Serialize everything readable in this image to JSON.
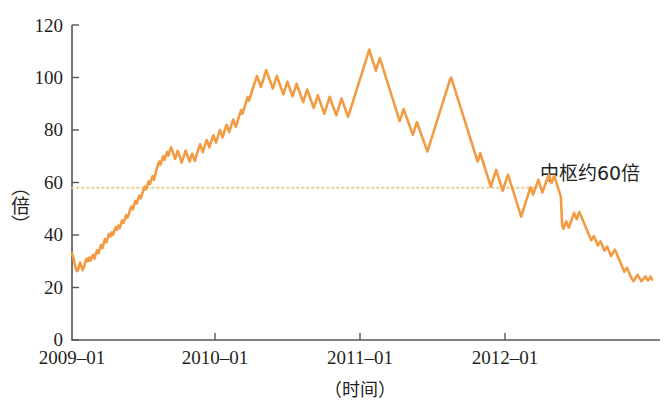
{
  "chart_data": {
    "type": "line",
    "title": "",
    "xlabel": "（时间）",
    "ylabel": "（倍）",
    "ylim": [
      0,
      120
    ],
    "yticks": [
      0,
      20,
      40,
      60,
      80,
      100,
      120
    ],
    "ytick_labels": [
      "0",
      "20",
      "40",
      "60",
      "80",
      "100",
      "120"
    ],
    "xticks": [
      "2009-01",
      "2010-01",
      "2011-01",
      "2012-01"
    ],
    "xtick_labels": [
      "2009–01",
      "2010–01",
      "2011–01",
      "2012–01"
    ],
    "xlim": [
      "2009-01",
      "2012-11"
    ],
    "grid": false,
    "legend": null,
    "series_color": "#F39B42",
    "reference_line": {
      "value": 58,
      "color": "#E8CE8A",
      "style": "dotted",
      "label": "中枢约60倍",
      "x_start": "2009-01",
      "x_end": "2012-04"
    },
    "annotations": [
      {
        "text": "中枢约60倍",
        "value": 60
      }
    ],
    "series": [
      {
        "name": "市盈率",
        "values": [
          33.0,
          31.5,
          29.0,
          27.0,
          26.2,
          27.5,
          29.5,
          28.2,
          26.6,
          27.8,
          29.6,
          31.0,
          30.0,
          31.4,
          30.2,
          31.6,
          32.4,
          31.0,
          32.8,
          34.2,
          33.0,
          34.6,
          36.2,
          35.0,
          36.8,
          38.4,
          37.2,
          38.8,
          40.4,
          39.4,
          41.0,
          40.0,
          41.6,
          43.0,
          42.0,
          43.6,
          42.6,
          44.2,
          45.6,
          44.6,
          46.0,
          47.6,
          46.6,
          48.0,
          49.6,
          50.8,
          49.8,
          51.4,
          53.0,
          52.0,
          53.6,
          55.0,
          54.0,
          55.6,
          57.0,
          58.4,
          57.4,
          59.0,
          60.4,
          59.4,
          61.0,
          62.4,
          61.0,
          63.0,
          65.0,
          66.6,
          68.0,
          66.8,
          68.4,
          70.0,
          68.6,
          70.2,
          71.6,
          70.2,
          72.0,
          73.4,
          72.0,
          70.6,
          69.0,
          70.4,
          72.0,
          70.6,
          69.2,
          67.6,
          69.0,
          70.6,
          72.2,
          70.8,
          69.4,
          68.0,
          69.6,
          71.0,
          69.6,
          68.2,
          70.0,
          71.6,
          73.2,
          74.6,
          73.0,
          71.6,
          73.2,
          74.8,
          76.2,
          74.8,
          73.4,
          75.0,
          76.6,
          78.0,
          76.6,
          75.2,
          76.8,
          78.4,
          80.0,
          78.6,
          77.2,
          78.8,
          80.4,
          82.0,
          80.6,
          79.2,
          80.8,
          82.4,
          84.0,
          82.6,
          81.2,
          82.8,
          84.4,
          86.0,
          87.6,
          86.2,
          87.8,
          89.4,
          91.0,
          92.6,
          91.2,
          92.8,
          94.4,
          96.0,
          97.6,
          99.0,
          100.6,
          99.2,
          97.8,
          96.4,
          98.0,
          99.6,
          101.2,
          102.8,
          101.4,
          100.0,
          98.6,
          97.2,
          95.8,
          97.4,
          99.0,
          100.6,
          99.2,
          97.8,
          96.4,
          95.0,
          93.6,
          95.2,
          96.8,
          98.4,
          97.0,
          95.6,
          94.2,
          92.8,
          94.4,
          96.0,
          97.6,
          96.2,
          94.8,
          93.4,
          92.0,
          90.6,
          92.2,
          93.8,
          95.4,
          94.0,
          92.6,
          91.2,
          89.8,
          88.4,
          90.0,
          91.6,
          93.2,
          91.8,
          90.4,
          89.0,
          87.6,
          86.2,
          87.8,
          89.4,
          91.0,
          92.6,
          91.2,
          89.8,
          88.4,
          87.0,
          85.6,
          87.2,
          88.8,
          90.4,
          92.0,
          90.6,
          89.2,
          87.8,
          86.4,
          85.0,
          86.6,
          88.2,
          89.8,
          91.4,
          93.0,
          94.6,
          96.2,
          97.8,
          99.4,
          101.0,
          102.6,
          104.2,
          105.8,
          107.4,
          109.0,
          110.6,
          109.0,
          107.4,
          105.8,
          104.2,
          102.6,
          104.2,
          105.8,
          107.4,
          105.8,
          104.2,
          102.6,
          101.0,
          99.4,
          97.8,
          96.2,
          94.6,
          93.0,
          91.4,
          89.8,
          88.2,
          86.6,
          85.0,
          83.4,
          84.8,
          86.4,
          88.0,
          86.6,
          85.2,
          83.8,
          82.4,
          81.0,
          79.6,
          78.2,
          79.8,
          81.4,
          83.0,
          81.6,
          80.2,
          78.8,
          77.4,
          76.0,
          74.6,
          73.2,
          71.8,
          73.4,
          75.0,
          76.6,
          78.2,
          79.8,
          81.4,
          83.0,
          84.6,
          86.2,
          87.8,
          89.4,
          91.0,
          92.6,
          94.2,
          95.8,
          97.4,
          99.0,
          100.0,
          98.4,
          96.8,
          95.2,
          93.6,
          92.0,
          90.4,
          88.8,
          87.2,
          85.6,
          84.0,
          82.4,
          80.8,
          79.2,
          77.6,
          76.0,
          74.4,
          72.8,
          71.2,
          69.6,
          68.0,
          69.6,
          71.2,
          69.6,
          68.0,
          66.4,
          64.8,
          63.2,
          61.6,
          60.0,
          58.4,
          60.0,
          61.6,
          63.2,
          64.8,
          63.2,
          61.6,
          60.0,
          58.4,
          56.8,
          58.4,
          60.0,
          61.6,
          63.0,
          61.4,
          59.8,
          58.2,
          56.6,
          55.0,
          53.4,
          51.8,
          50.2,
          48.6,
          47.0,
          48.6,
          50.2,
          51.8,
          53.4,
          55.0,
          56.6,
          58.2,
          57.0,
          55.4,
          56.8,
          58.2,
          59.6,
          61.0,
          59.4,
          57.8,
          56.2,
          57.6,
          59.0,
          60.4,
          61.8,
          63.0,
          61.4,
          59.8,
          61.2,
          62.6,
          61.0,
          59.4,
          57.8,
          56.2,
          54.6,
          43.8,
          42.4,
          43.8,
          45.2,
          44.0,
          42.8,
          44.2,
          45.6,
          47.0,
          48.4,
          47.2,
          46.0,
          47.4,
          48.8,
          47.6,
          46.4,
          45.2,
          44.0,
          42.8,
          41.6,
          40.4,
          39.2,
          38.0,
          38.8,
          39.6,
          38.4,
          37.2,
          36.0,
          36.8,
          37.6,
          36.4,
          35.2,
          34.0,
          34.8,
          35.6,
          34.4,
          33.2,
          32.0,
          32.8,
          33.6,
          34.4,
          33.2,
          32.0,
          30.8,
          29.6,
          28.4,
          27.2,
          26.0,
          26.8,
          27.6,
          26.4,
          25.2,
          24.0,
          23.2,
          22.4,
          23.2,
          24.0,
          24.8,
          24.0,
          23.2,
          22.4,
          23.0,
          23.6,
          24.2,
          23.4,
          22.6,
          23.4,
          24.2,
          23.0
        ]
      }
    ]
  },
  "plot": {
    "axis_color": "#555555",
    "background": "#ffffff"
  }
}
